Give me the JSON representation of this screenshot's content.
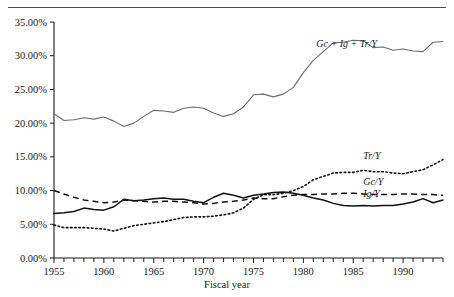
{
  "chart_data": {
    "type": "line",
    "title": "",
    "xlabel": "Fiscal year",
    "ylabel": "",
    "xlim": [
      1955,
      1994
    ],
    "ylim": [
      0,
      35
    ],
    "grid": false,
    "legend_position": "inline-right-annotations",
    "y_tick_labels": [
      "0.00%",
      "5.00%",
      "10.00%",
      "15.00%",
      "20.00%",
      "25.00%",
      "30.00%",
      "35.00%"
    ],
    "y_tick_values": [
      0,
      5,
      10,
      15,
      20,
      25,
      30,
      35
    ],
    "x_tick_labels": [
      "1955",
      "1960",
      "1965",
      "1970",
      "1975",
      "1980",
      "1985",
      "1990"
    ],
    "x_tick_values": [
      1955,
      1960,
      1965,
      1970,
      1975,
      1980,
      1985,
      1990
    ],
    "x_minor_tick_interval": 1,
    "x": [
      1955,
      1956,
      1957,
      1958,
      1959,
      1960,
      1961,
      1962,
      1963,
      1964,
      1965,
      1966,
      1967,
      1968,
      1969,
      1970,
      1971,
      1972,
      1973,
      1974,
      1975,
      1976,
      1977,
      1978,
      1979,
      1980,
      1981,
      1982,
      1983,
      1984,
      1985,
      1986,
      1987,
      1988,
      1989,
      1990,
      1991,
      1992,
      1993,
      1994
    ],
    "series": [
      {
        "name": "Gc + Ig + Tr/Y",
        "label": "Gc + Ig + Tr/Y",
        "style": "solid-gray",
        "color": "#6b6b6b",
        "label_x": 1981.3,
        "label_y": 31.3,
        "values": [
          21.4,
          20.4,
          20.5,
          20.8,
          20.6,
          20.9,
          20.3,
          19.5,
          20.0,
          21.0,
          21.9,
          21.8,
          21.6,
          22.2,
          22.4,
          22.2,
          21.5,
          21.0,
          21.4,
          22.4,
          24.2,
          24.3,
          23.9,
          24.3,
          25.3,
          27.5,
          29.3,
          30.6,
          31.9,
          32.0,
          32.3,
          32.2,
          31.2,
          31.3,
          30.8,
          31.0,
          30.7,
          30.6,
          32.0,
          32.1
        ]
      },
      {
        "name": "Tr/Y",
        "label": "Tr/Y",
        "style": "dotted",
        "color": "#111111",
        "label_x": 1986.0,
        "label_y": 14.7,
        "values": [
          4.9,
          4.5,
          4.5,
          4.5,
          4.4,
          4.3,
          4.0,
          4.4,
          4.8,
          5.0,
          5.2,
          5.4,
          5.7,
          6.0,
          6.1,
          6.1,
          6.2,
          6.4,
          6.7,
          7.4,
          8.7,
          9.4,
          9.4,
          9.6,
          10.0,
          10.6,
          11.6,
          12.1,
          12.6,
          12.7,
          12.7,
          13.0,
          12.8,
          12.8,
          12.6,
          12.5,
          12.8,
          13.1,
          13.8,
          14.6
        ]
      },
      {
        "name": "Gc/Y",
        "label": "Gc/Y",
        "style": "dashed",
        "color": "#111111",
        "label_x": 1986.0,
        "label_y": 10.9,
        "values": [
          10.0,
          9.5,
          9.0,
          8.6,
          8.4,
          8.2,
          8.3,
          8.6,
          8.5,
          8.4,
          8.3,
          8.4,
          8.4,
          8.3,
          8.2,
          8.0,
          8.1,
          8.3,
          8.4,
          8.6,
          8.9,
          8.8,
          8.8,
          9.1,
          9.3,
          9.4,
          9.4,
          9.5,
          9.5,
          9.6,
          9.6,
          9.5,
          9.4,
          9.4,
          9.4,
          9.5,
          9.5,
          9.4,
          9.4,
          9.3
        ]
      },
      {
        "name": "Ig/Y",
        "label": "Ig/Y",
        "style": "solid",
        "color": "#111111",
        "label_x": 1986.0,
        "label_y": 9.0,
        "values": [
          6.6,
          6.7,
          6.9,
          7.4,
          7.2,
          7.1,
          7.6,
          8.7,
          8.5,
          8.6,
          8.8,
          8.9,
          8.7,
          8.7,
          8.4,
          8.2,
          9.0,
          9.6,
          9.3,
          8.9,
          9.3,
          9.5,
          9.7,
          9.8,
          9.6,
          9.3,
          8.9,
          8.6,
          8.1,
          7.8,
          7.7,
          7.8,
          7.7,
          7.8,
          7.8,
          8.0,
          8.3,
          8.8,
          8.2,
          8.6
        ]
      }
    ]
  },
  "figure": {
    "x_axis_title": "Fiscal year"
  }
}
